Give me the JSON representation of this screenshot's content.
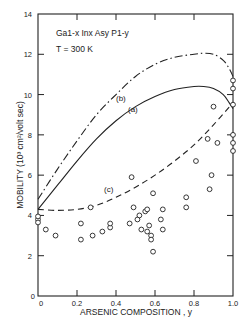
{
  "chart_data": {
    "type": "scatter",
    "title": "",
    "annotation_material": "Ga1-x Inx Asy P1-y",
    "annotation_temp": "T = 300 K",
    "xlabel": "ARSENIC COMPOSITION , y",
    "ylabel": "MOBILITY (10³ cm²/volt sec)",
    "xlim": [
      0,
      1.0
    ],
    "ylim": [
      0,
      14
    ],
    "x_ticks": [
      "0",
      "0.2",
      "0.4",
      "0.6",
      "0.8",
      "1.0"
    ],
    "y_ticks": [
      "0",
      "2",
      "4",
      "6",
      "8",
      "10",
      "12",
      "14"
    ],
    "grid": false,
    "legend": "none (inline curve labels)",
    "series": [
      {
        "name": "(a)",
        "style": "solid",
        "x": [
          0,
          0.1,
          0.2,
          0.3,
          0.4,
          0.5,
          0.6,
          0.7,
          0.8,
          0.85,
          0.9,
          0.95,
          0.98,
          1.0
        ],
        "values": [
          4.3,
          5.5,
          6.7,
          7.8,
          8.7,
          9.4,
          9.9,
          10.25,
          10.4,
          10.4,
          10.3,
          10.0,
          9.6,
          9.3
        ]
      },
      {
        "name": "(b)",
        "style": "dash-dot",
        "x": [
          0,
          0.1,
          0.2,
          0.3,
          0.4,
          0.5,
          0.6,
          0.7,
          0.8,
          0.85,
          0.9,
          0.95,
          0.98,
          1.0
        ],
        "values": [
          4.8,
          6.3,
          7.7,
          9.0,
          10.0,
          10.9,
          11.5,
          11.85,
          12.0,
          12.05,
          12.0,
          11.7,
          11.3,
          10.9
        ]
      },
      {
        "name": "(c)",
        "style": "dashed",
        "x": [
          0,
          0.1,
          0.2,
          0.3,
          0.4,
          0.5,
          0.6,
          0.7,
          0.8,
          0.9,
          1.0
        ],
        "values": [
          4.3,
          4.25,
          4.3,
          4.5,
          4.9,
          5.4,
          6.0,
          6.7,
          7.5,
          8.5,
          9.6
        ]
      },
      {
        "name": "experimental",
        "style": "open-circles",
        "points": [
          [
            0.0,
            3.8
          ],
          [
            0.0,
            3.95
          ],
          [
            0.0,
            3.65
          ],
          [
            0.04,
            3.3
          ],
          [
            0.09,
            3.0
          ],
          [
            0.22,
            2.8
          ],
          [
            0.22,
            3.6
          ],
          [
            0.28,
            3.0
          ],
          [
            0.33,
            3.2
          ],
          [
            0.37,
            3.4
          ],
          [
            0.37,
            3.6
          ],
          [
            0.27,
            4.4
          ],
          [
            0.47,
            3.6
          ],
          [
            0.48,
            5.9
          ],
          [
            0.49,
            4.4
          ],
          [
            0.51,
            3.8
          ],
          [
            0.52,
            4.0
          ],
          [
            0.53,
            3.3
          ],
          [
            0.55,
            4.2
          ],
          [
            0.56,
            4.3
          ],
          [
            0.56,
            3.2
          ],
          [
            0.57,
            3.5
          ],
          [
            0.58,
            3.0
          ],
          [
            0.58,
            2.8
          ],
          [
            0.59,
            2.2
          ],
          [
            0.59,
            5.1
          ],
          [
            0.63,
            3.8
          ],
          [
            0.64,
            4.3
          ],
          [
            0.64,
            3.3
          ],
          [
            0.76,
            4.4
          ],
          [
            0.76,
            4.9
          ],
          [
            0.81,
            6.7
          ],
          [
            0.87,
            7.8
          ],
          [
            0.88,
            5.3
          ],
          [
            0.89,
            6.0
          ],
          [
            0.92,
            7.6
          ],
          [
            0.9,
            9.4
          ],
          [
            1.0,
            10.7
          ],
          [
            1.0,
            10.3
          ],
          [
            1.0,
            9.5
          ],
          [
            1.0,
            8.0
          ],
          [
            1.0,
            7.6
          ],
          [
            1.0,
            7.2
          ]
        ]
      }
    ]
  },
  "labels": {
    "curve_a": "(a)",
    "curve_b": "(b)",
    "curve_c": "(c)",
    "x_origin": "0",
    "y_origin": "0"
  }
}
